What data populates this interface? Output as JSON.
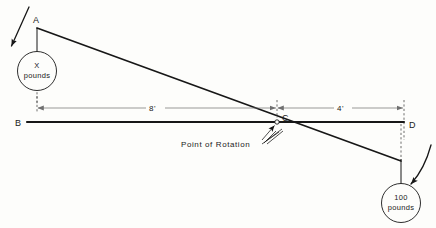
{
  "figure": {
    "background_color": "#fdfdfb",
    "line_color": "#171717",
    "dimension_color": "#6f6f6f"
  },
  "points": {
    "a": "A",
    "b": "B",
    "c": "C",
    "d": "D"
  },
  "dimensions": [
    {
      "label": "8'",
      "from": "B",
      "to": "C"
    },
    {
      "label": "4'",
      "from": "C",
      "to": "D"
    }
  ],
  "annotations": {
    "point_of_rotation": "Point of Rotation"
  },
  "loads": {
    "left": {
      "amount": "X",
      "unit": "pounds",
      "direction": "down-left"
    },
    "right": {
      "amount": "100",
      "unit": "pounds",
      "direction": "down"
    }
  },
  "icons": {
    "left_force_arrow": "arrow-down-left-icon",
    "right_force_arrow": "curved-arrow-down-icon",
    "pivot_marker": "pivot-point-icon"
  }
}
